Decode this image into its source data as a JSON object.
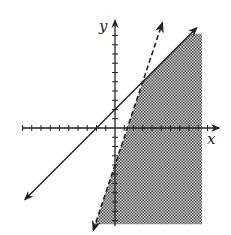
{
  "chart_data": {
    "type": "line",
    "title": "",
    "xlabel": "x",
    "ylabel": "y",
    "xlim": [
      -10,
      10
    ],
    "ylim": [
      -10,
      11
    ],
    "tick_step": 1,
    "tick_labels_shown": false,
    "grid": false,
    "series": [
      {
        "name": "boundary-solid",
        "equation": "y = x + 2",
        "style": "solid",
        "slope": 1,
        "intercept": 2,
        "arrows": "both"
      },
      {
        "name": "boundary-dashed",
        "equation": "y = 3x - 4",
        "style": "dashed",
        "slope": 3,
        "intercept": -4,
        "arrows": "both"
      }
    ],
    "intersection": {
      "x": 3,
      "y": 5
    },
    "shaded_region": {
      "description": "y <= x + 2 and y > 3x - 4",
      "fill": "crosshatch",
      "clip_x_max": 9.4,
      "clip_y_min": -10.4,
      "clip_y_max": 10.2
    }
  },
  "labels": {
    "x_axis": "x",
    "y_axis": "y"
  },
  "colors": {
    "line": "#222222",
    "shade_dark": "#555555",
    "shade_light": "#d8d8d8",
    "background": "#ffffff"
  }
}
